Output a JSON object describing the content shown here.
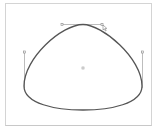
{
  "editor": {
    "type": "bezier-path-editor",
    "colors": {
      "frame_border": "#d4d4d4",
      "path_stroke": "#555555",
      "handle_line": "#999999",
      "anchor_point": "#888888",
      "background": "#ffffff"
    },
    "path": {
      "closed": true,
      "anchors": [
        {
          "name": "top",
          "x": 83,
          "y": 24,
          "handle_in": [
            62,
            24
          ],
          "handle_out": [
            102,
            24
          ]
        },
        {
          "name": "right",
          "x": 142,
          "y": 88,
          "handle_in": [
            142,
            52
          ],
          "handle_out": [
            142,
            100
          ]
        },
        {
          "name": "left",
          "x": 24,
          "y": 88,
          "handle_in": [
            24,
            100
          ],
          "handle_out": [
            24,
            52
          ]
        }
      ],
      "center": [
        83,
        68
      ]
    },
    "cursor": {
      "icon": "arrow-cursor-icon",
      "x": 104,
      "y": 26
    }
  }
}
